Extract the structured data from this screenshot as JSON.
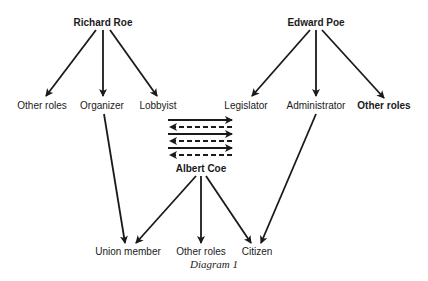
{
  "diagram": {
    "caption": "Diagram 1",
    "nodes": {
      "richard_roe": "Richard Roe",
      "edward_poe": "Edward Poe",
      "albert_coe": "Albert Coe",
      "rr_other_roles": "Other roles",
      "organizer": "Organizer",
      "lobbyist": "Lobbyist",
      "legislator": "Legislator",
      "administrator": "Administrator",
      "ep_other_roles": "Other roles",
      "union_member": "Union member",
      "ac_other_roles": "Other roles",
      "citizen": "Citizen"
    },
    "edges": [
      {
        "from": "Richard Roe",
        "to": "Other roles"
      },
      {
        "from": "Richard Roe",
        "to": "Organizer"
      },
      {
        "from": "Richard Roe",
        "to": "Lobbyist"
      },
      {
        "from": "Edward Poe",
        "to": "Legislator"
      },
      {
        "from": "Edward Poe",
        "to": "Administrator"
      },
      {
        "from": "Edward Poe",
        "to": "Other roles"
      },
      {
        "from": "Organizer",
        "to": "Union member"
      },
      {
        "from": "Administrator",
        "to": "Citizen"
      },
      {
        "from": "Albert Coe",
        "to": "Union member"
      },
      {
        "from": "Albert Coe",
        "to": "Other roles"
      },
      {
        "from": "Albert Coe",
        "to": "Citizen"
      }
    ],
    "exchange_arrows": {
      "solid_right": 3,
      "dashed_left": 3
    }
  }
}
